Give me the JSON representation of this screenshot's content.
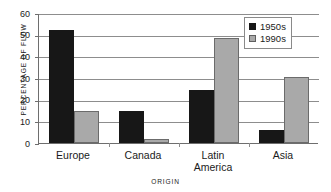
{
  "chart_data": {
    "type": "bar",
    "title": "",
    "xlabel": "ORIGIN",
    "ylabel": "PERCENTAGE OF FLOW",
    "categories": [
      "Europe",
      "Canada",
      "Latin America",
      "Asia"
    ],
    "category_lines": [
      [
        "Europe"
      ],
      [
        "Canada"
      ],
      [
        "Latin",
        "America"
      ],
      [
        "Asia"
      ]
    ],
    "series": [
      {
        "name": "1950s",
        "color": "#171717",
        "values": [
          52,
          15,
          24.5,
          6
        ]
      },
      {
        "name": "1990s",
        "color": "#a9a9a9",
        "values": [
          15,
          2,
          48.5,
          30.5
        ]
      }
    ],
    "ylim": [
      0,
      60
    ],
    "ytick_values": [
      0,
      10,
      20,
      30,
      40,
      50,
      60
    ],
    "ytick_labels": [
      "0",
      "10",
      "20",
      "30",
      "40",
      "50",
      "60"
    ],
    "grid": true,
    "grid_axis": "y",
    "legend_position": "top-right"
  }
}
